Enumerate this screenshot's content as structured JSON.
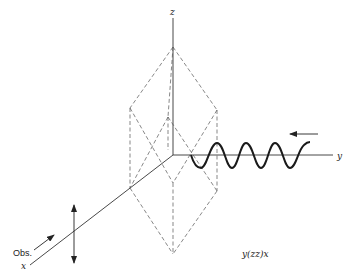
{
  "figure": {
    "axes": {
      "z_label": "z",
      "y_label": "y",
      "x_label": "x"
    },
    "observer_label": "Obs.",
    "scattering_notation": "y(zz)x",
    "elements": {
      "crystal_shape": "dashed rhombohedron",
      "incident_wave": "sinusoidal light wave along y-axis",
      "incident_direction_arrow": "left-pointing arrow above wave",
      "polarization_arrow": "vertical double-headed arrow on x-axis",
      "observation_arrow": "arrow toward crystal along x-axis"
    }
  }
}
